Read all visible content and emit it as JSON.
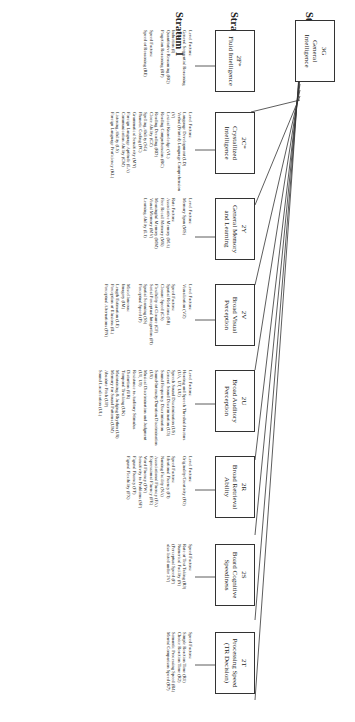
{
  "strata": [
    "Stratum III",
    "Stratum II",
    "Stratum I"
  ],
  "general": {
    "code": "3G",
    "name": "General Intelligence"
  },
  "broad": [
    {
      "code": "2F*",
      "name": "Fluid Intelligence",
      "factors": "Level Factors:\nGeneral Sequential Reasoning (RG)\nInduction (I)\nQuantitative Reasoning (RQ)\nPiagetian Reasoning (RP)\n\nSpeed Factors:\nSpeed of Reasoning (RE)"
    },
    {
      "code": "2C*",
      "name": "Crystallized Intelligence",
      "factors": "Level Factors:\nLanguage Development (LD)\nVerbal (Printed) Language Comprehension (V)\nLexical Knowledge (VL)\nReading Comprehension (RC)\nReading Decoding (RD)\nCloze Ability (CZ)\nSpelling Ability (SG)\nPhonetic Coding (PC)\nGrammatical Sensitivity (MY)\nForeign Language Aptitude (LA)\nCommunication Ability (CM)\nListening Ability (LS)\nForeign Language Proficiency (KL)"
    },
    {
      "code": "2Y",
      "name": "General Memory and Learning",
      "factors": "Level Factors:\nMemory Span (MS)\n\nRate Factors:\nAssociative Memory (MA)\nFree Recall Memory (M6)\nMeaningful Memory (MM)\nVisual Memory (MV)\nLearning Ability (L1)"
    },
    {
      "code": "2V",
      "name": "Broad Visual Perception",
      "factors": "Level Factors:\nVisualization (VZ)\n\nSpeed Factors:\nSpatial Relations (SR)\nClosure Speed (CS)\nFlexibility of Closure (CF)\nSerial Perceptual Integration (PI)\nSpatial Scanning (SS)\nPerceptual Speed (P)\n\nMiscellaneous:\nImagery (IM)\nLength Estimation (LE)\nPerception of Illusions (IL)\nPerceptual Alternations (PN)"
    },
    {
      "code": "2U",
      "name": "Broad Auditory Perception",
      "factors": "Level Factors:\nHearing and Speech Threshold factors (UA, UT, UU)\nSpeech Sound Discrimination (US)\nGeneral Sound Discrimination (U3)\nSound Frequency Discrimination\nSound-Intensity/Duration Discrimination (U6)\nMusical Discrimination and Judgment (U1, U9)\nResistance to Auditory Stimulus Distortion (UR)\nTemporal Tracking (UK)\nMaintaining & Judging Rhythm (U8)\nMemory for Sound Patterns (UM)\nAbsolute Pitch (UP)\nSound Localization (UL)"
    },
    {
      "code": "2R",
      "name": "Broad Retrieval Ability",
      "factors": "Level Factors:\nOriginality/Creativity (FO)\n\nSpeed Factors:\nIdeational Fluency (FI)\nNaming Facility (NA)\nAssociational Fluency (FA)\nExpressional Fluency (FE)\nWord Fluency (FW)\nSensitivity to Problems (SP)\nFigural Fluency (FF)\nFigural Flexibility (FX)"
    },
    {
      "code": "2S",
      "name": "Board Cognitive Speediness",
      "factors": "Speed Factors:\nRate of Test Taking (R9)\nNumerical Facility (N)\n(Perceptual Speed (P)\nalso listed under 2V)"
    },
    {
      "code": "2T",
      "name": "Processing Speed (TR Decision)",
      "factors": "Speed Factors:\nSimple Reaction Time (R1)\nChoice Reaction Time (R2)\nSemantic Processing Speed (R4)\nMental Comparison Speed (R7)"
    }
  ],
  "colors": {
    "line": "#333333",
    "text": "#222222",
    "background": "#ffffff"
  }
}
